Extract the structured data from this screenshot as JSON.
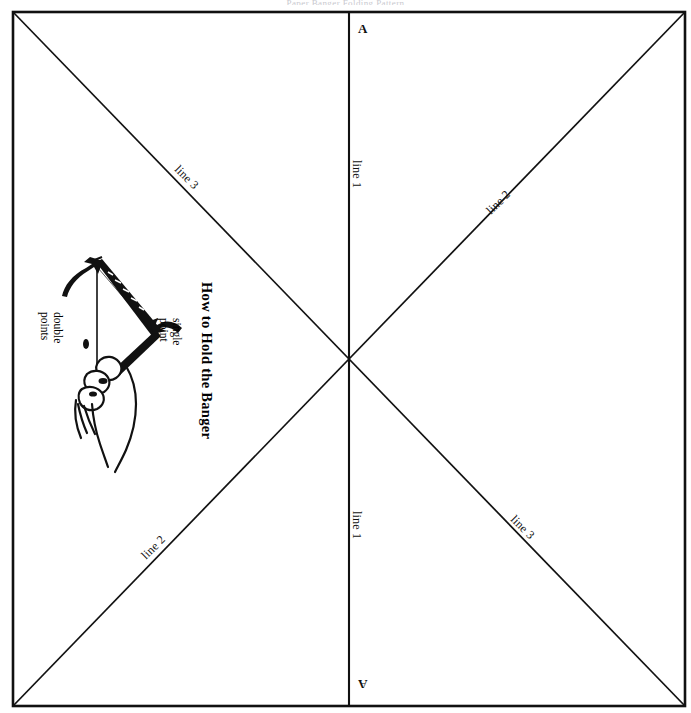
{
  "document": {
    "title": "How to Hold the Banger",
    "clipped_header_text": "Paper Banger Folding Pattern",
    "sheet": {
      "description": "Square folding sheet with border rectangle and crossing fold lines",
      "background_color": "#ffffff",
      "ink_color": "#000000",
      "border": {
        "left": 13,
        "top": 12,
        "right": 685,
        "bottom": 706,
        "stroke_width": 2.4
      }
    }
  },
  "fold_lines": [
    {
      "id": "center-vertical",
      "name": "line 1",
      "kind": "vertical",
      "from": [
        349,
        12
      ],
      "to": [
        349,
        706
      ],
      "stroke_width": 2.0
    },
    {
      "id": "diagonal-tl-br",
      "name": "line 3 / line 3",
      "kind": "diagonal",
      "from": [
        13,
        12
      ],
      "to": [
        685,
        706
      ],
      "stroke_width": 1.6
    },
    {
      "id": "diagonal-bl-tr",
      "name": "line 2 / line 2",
      "kind": "diagonal",
      "from": [
        13,
        706
      ],
      "to": [
        685,
        12
      ],
      "stroke_width": 1.6
    }
  ],
  "corner_marks": [
    {
      "id": "mark-top",
      "label": "A",
      "x": 358,
      "y": 28,
      "rotation": 0
    },
    {
      "id": "mark-bottom",
      "label": "A",
      "x": 358,
      "y": 684,
      "rotation": 180
    }
  ],
  "line_labels": [
    {
      "id": "label-line3-upper-left",
      "text": "line 3",
      "x": 182,
      "y": 163,
      "rotation": 45
    },
    {
      "id": "label-line1-upper",
      "text": "line 1",
      "x": 357,
      "y": 160,
      "rotation": 90
    },
    {
      "id": "label-line2-upper-right",
      "text": "line 2",
      "x": 487,
      "y": 207,
      "rotation": -45
    },
    {
      "id": "label-line2-lower-left",
      "text": "line 2",
      "x": 140,
      "y": 551,
      "rotation": -45
    },
    {
      "id": "label-line1-lower",
      "text": "line 1",
      "x": 357,
      "y": 511,
      "rotation": 90
    },
    {
      "id": "label-line3-lower-right",
      "text": "line 3",
      "x": 518,
      "y": 513,
      "rotation": 45
    }
  ],
  "illustration": {
    "id": "how-to-hold-the-banger",
    "heading": "How to Hold the Banger",
    "heading_rotation": 90,
    "callouts": [
      {
        "id": "callout-double-points",
        "lines": [
          "double",
          "points"
        ],
        "arrow": "curved-arrow-up-left"
      },
      {
        "id": "callout-single-point",
        "lines": [
          "single",
          "point"
        ],
        "arrow": "curved-arrow-left"
      }
    ],
    "subject": "A hand gripping a folded paper banger by its single point, with the double points at the top"
  }
}
